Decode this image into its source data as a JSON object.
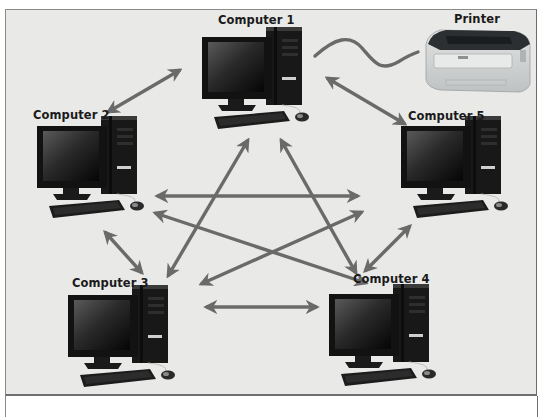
{
  "diagram": {
    "type": "peer-to-peer network",
    "nodes": [
      {
        "id": "computer1",
        "label": "Computer 1",
        "x": 262,
        "y": 20
      },
      {
        "id": "computer2",
        "label": "Computer 2",
        "x": 33,
        "y": 107
      },
      {
        "id": "computer3",
        "label": "Computer 3",
        "x": 72,
        "y": 279
      },
      {
        "id": "computer4",
        "label": "Computer 4",
        "x": 353,
        "y": 276
      },
      {
        "id": "computer5",
        "label": "Computer 5",
        "x": 412,
        "y": 108
      },
      {
        "id": "printer",
        "label": "Printer",
        "x": 474,
        "y": 14
      }
    ],
    "connections": [
      {
        "from": "computer1",
        "to": "computer2",
        "type": "bidirectional-arrow"
      },
      {
        "from": "computer1",
        "to": "computer5",
        "type": "bidirectional-arrow"
      },
      {
        "from": "computer1",
        "to": "computer3",
        "type": "bidirectional-arrow"
      },
      {
        "from": "computer1",
        "to": "computer4",
        "type": "bidirectional-arrow"
      },
      {
        "from": "computer2",
        "to": "computer5",
        "type": "bidirectional-arrow"
      },
      {
        "from": "computer2",
        "to": "computer4",
        "type": "bidirectional-arrow"
      },
      {
        "from": "computer2",
        "to": "computer3",
        "type": "bidirectional-arrow"
      },
      {
        "from": "computer5",
        "to": "computer3",
        "type": "bidirectional-arrow"
      },
      {
        "from": "computer5",
        "to": "computer4",
        "type": "bidirectional-arrow"
      },
      {
        "from": "computer3",
        "to": "computer4",
        "type": "bidirectional-arrow"
      },
      {
        "from": "computer1",
        "to": "printer",
        "type": "cable"
      }
    ]
  },
  "colors": {
    "background": "#e9e9e8",
    "arrow": "#6a6a6a",
    "cable": "#6a6a6a",
    "computer": "#141414",
    "printer_body": "#d4d6d6",
    "printer_top": "#2a2e30"
  }
}
